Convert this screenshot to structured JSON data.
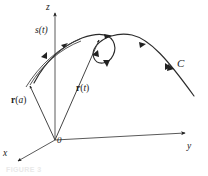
{
  "figure": {
    "caption": "FIGURE 3",
    "colors": {
      "ink": "#1a1a1a",
      "axis": "#4a4a4a",
      "curve": "#2b2b2b",
      "background": "#ffffff"
    },
    "axes": [
      {
        "id": "z",
        "label": "z",
        "label_x": 47,
        "label_y": 4
      },
      {
        "id": "x",
        "label": "x",
        "label_x": 4,
        "label_y": 150
      },
      {
        "id": "y",
        "label": "y",
        "label_x": 188,
        "label_y": 145
      }
    ],
    "origin": {
      "label": "0",
      "label_x": 58,
      "label_y": 136
    },
    "vectors": [
      {
        "id": "r-of-a",
        "name": "r(a)",
        "bold_part": "r",
        "paren_open": "(",
        "italic_part": "a",
        "paren_close": ")",
        "label_x": 12,
        "label_y": 99
      },
      {
        "id": "r-of-t",
        "name": "r(t)",
        "bold_part": "r",
        "paren_open": "(",
        "italic_part": "t",
        "paren_close": ")",
        "label_x": 77,
        "label_y": 87
      }
    ],
    "arc_length": {
      "label": "s(t)",
      "text_s": "s",
      "text_paren_open": "(",
      "text_t": "t",
      "text_paren_close": ")",
      "label_x": 37,
      "label_y": 28
    },
    "curve": {
      "label": "C",
      "label_x": 178,
      "label_y": 62
    }
  }
}
